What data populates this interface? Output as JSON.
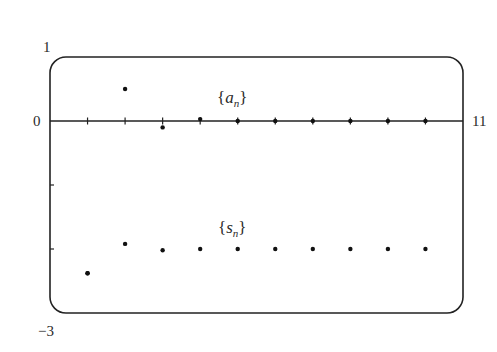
{
  "chart_data": {
    "type": "scatter",
    "title": "",
    "xlabel": "",
    "ylabel": "",
    "xlim": [
      0,
      11
    ],
    "ylim": [
      -3,
      1
    ],
    "grid": false,
    "legend": "inline labels",
    "axis_labels": {
      "y_top": "1",
      "y_zero": "0",
      "y_bottom": "−3",
      "x_right": "11"
    },
    "x": [
      1,
      2,
      3,
      4,
      5,
      6,
      7,
      8,
      9,
      10
    ],
    "series": [
      {
        "name": "{a_n}",
        "label_main": "a",
        "label_sub": "n",
        "values": [
          -2.38,
          0.5,
          -0.1,
          0.03,
          0.0,
          0.0,
          0.0,
          0.0,
          0.0,
          0.0
        ]
      },
      {
        "name": "{s_n}",
        "label_main": "s",
        "label_sub": "n",
        "values": [
          -2.38,
          -1.92,
          -2.02,
          -2.0,
          -2.0,
          -2.0,
          -2.0,
          -2.0,
          -2.0,
          -2.0
        ]
      }
    ]
  }
}
